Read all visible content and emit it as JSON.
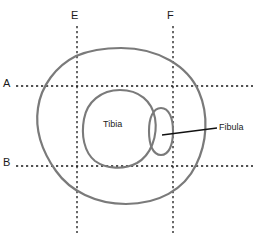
{
  "diagram": {
    "background_color": "#ffffff",
    "outline_color": "#7a7a7a",
    "guide_color": "#1a1a1a",
    "text_color": "#1a1a1a",
    "leader_color": "#111111",
    "axis_labels": [
      {
        "name": "A",
        "text": "A",
        "orientation": "horizontal",
        "position_px": 86
      },
      {
        "name": "B",
        "text": "B",
        "orientation": "horizontal",
        "position_px": 166
      },
      {
        "name": "E",
        "text": "E",
        "orientation": "vertical",
        "position_px": 77
      },
      {
        "name": "F",
        "text": "F",
        "orientation": "vertical",
        "position_px": 173
      }
    ],
    "structures": [
      {
        "name": "tibia",
        "label": "Tibia",
        "label_position": "inside"
      },
      {
        "name": "fibula",
        "label": "Fibula",
        "label_position": "leader-line-right"
      }
    ]
  }
}
